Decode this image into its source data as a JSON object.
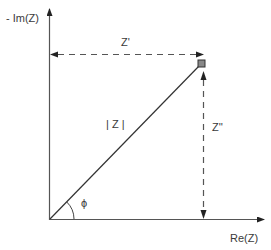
{
  "diagram": {
    "axes": {
      "y_label": "- Im(Z)",
      "x_label": "Re(Z)"
    },
    "labels": {
      "real_component": "Z'",
      "imaginary_component": "Z''",
      "magnitude": "| Z |",
      "phase_angle": "ϕ"
    },
    "colors": {
      "line": "#333333",
      "point_fill": "#888888",
      "text": "#3a3a3a"
    }
  }
}
